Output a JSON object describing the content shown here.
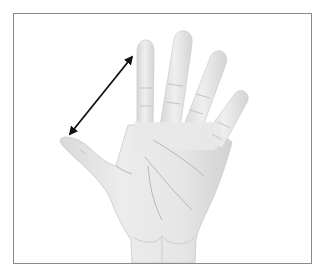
{
  "figure": {
    "annotation": "double-headed arrow measuring span from thumb tip to index fingertip",
    "colors": {
      "background": "#ffffff",
      "frame_border": "#8a8a8a",
      "skin_fill": "#e8e8e8",
      "skin_shadow": "#cfcfcf",
      "crease_line": "#b8b8b8",
      "arrow": "#111111"
    },
    "arrow": {
      "start": [
        70,
        134
      ],
      "end": [
        132,
        57
      ]
    }
  }
}
